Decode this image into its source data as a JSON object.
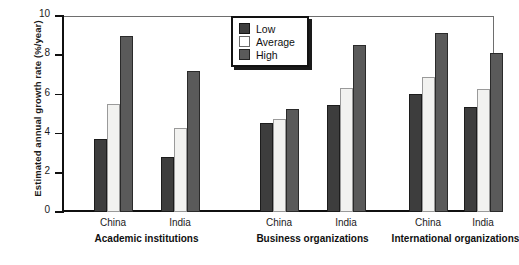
{
  "chart_data": {
    "type": "bar",
    "title": "",
    "xlabel": "",
    "ylabel": "Estimated annual growth rate (%/year)",
    "ylim": [
      0,
      10
    ],
    "yticks": [
      0,
      2,
      4,
      6,
      8,
      10
    ],
    "grid": false,
    "legend_position": "top-center",
    "categories": [
      "China",
      "India",
      "China",
      "India",
      "China",
      "India"
    ],
    "groups": [
      {
        "name": "Academic institutions",
        "categories": [
          "China",
          "India"
        ]
      },
      {
        "name": "Business organizations",
        "categories": [
          "China",
          "India"
        ]
      },
      {
        "name": "International organizations",
        "categories": [
          "China",
          "India"
        ]
      }
    ],
    "series": [
      {
        "name": "Low",
        "color": "#3d3d3d",
        "values": [
          3.75,
          2.8,
          4.55,
          5.45,
          6.0,
          5.35
        ]
      },
      {
        "name": "Average",
        "color": "#f2f2f0",
        "values": [
          5.5,
          4.3,
          4.75,
          6.35,
          6.9,
          6.3
        ]
      },
      {
        "name": "High",
        "color": "#5a5a5a",
        "values": [
          9.0,
          7.2,
          5.25,
          8.5,
          9.15,
          8.1
        ]
      }
    ]
  },
  "legend": {
    "entries": [
      {
        "label": "Low",
        "swatch": "low"
      },
      {
        "label": "Average",
        "swatch": "avg"
      },
      {
        "label": "High",
        "swatch": "high"
      }
    ]
  },
  "axis": {
    "y_title": "Estimated annual growth rate (%/year)",
    "y_ticks": [
      "0",
      "2",
      "4",
      "6",
      "8",
      "10"
    ]
  }
}
